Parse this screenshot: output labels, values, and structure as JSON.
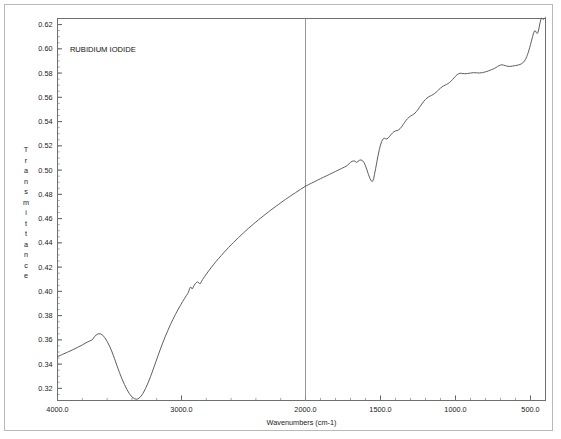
{
  "chart_data": {
    "type": "line",
    "title": "RUBIDIUM IODIDE",
    "xlabel": "Wavenumbers (cm-1)",
    "ylabel": "Transmittance",
    "grid": false,
    "legend": "none",
    "x_axis": {
      "unit": "cm-1",
      "direction": "descending",
      "piecewise": true,
      "break_at": 2000,
      "range": [
        4000.0,
        400.0
      ],
      "tick_labels": [
        "4000.0",
        "3000.0",
        "2000.0",
        "1500.0",
        "1000.0",
        "500.0"
      ],
      "tick_values": [
        4000,
        3000,
        2000,
        1500,
        1000,
        500
      ],
      "minor_tick_step_high": 200,
      "minor_tick_step_low": 100
    },
    "y_axis": {
      "ylim": [
        0.31,
        0.625
      ],
      "tick_labels": [
        "0.62",
        "0.60",
        "0.58",
        "0.56",
        "0.54",
        "0.52",
        "0.50",
        "0.48",
        "0.46",
        "0.44",
        "0.42",
        "0.40",
        "0.38",
        "0.36",
        "0.34",
        "0.32"
      ],
      "tick_values": [
        0.62,
        0.6,
        0.58,
        0.56,
        0.54,
        0.52,
        0.5,
        0.48,
        0.46,
        0.44,
        0.42,
        0.4,
        0.38,
        0.36,
        0.34,
        0.32
      ],
      "minor_tick_step": 0.005
    },
    "series": [
      {
        "name": "RUBIDIUM IODIDE",
        "color": "#555555",
        "points": [
          [
            4000,
            0.3462
          ],
          [
            3960,
            0.348
          ],
          [
            3920,
            0.3498
          ],
          [
            3880,
            0.3517
          ],
          [
            3840,
            0.3537
          ],
          [
            3800,
            0.3558
          ],
          [
            3770,
            0.3576
          ],
          [
            3740,
            0.3591
          ],
          [
            3720,
            0.36
          ],
          [
            3700,
            0.3629
          ],
          [
            3680,
            0.3646
          ],
          [
            3665,
            0.3651
          ],
          [
            3650,
            0.3648
          ],
          [
            3635,
            0.3638
          ],
          [
            3620,
            0.362
          ],
          [
            3600,
            0.3588
          ],
          [
            3580,
            0.3548
          ],
          [
            3560,
            0.35
          ],
          [
            3540,
            0.3444
          ],
          [
            3520,
            0.3386
          ],
          [
            3500,
            0.333
          ],
          [
            3480,
            0.3278
          ],
          [
            3460,
            0.3232
          ],
          [
            3440,
            0.319
          ],
          [
            3420,
            0.3156
          ],
          [
            3400,
            0.313
          ],
          [
            3380,
            0.3115
          ],
          [
            3365,
            0.311
          ],
          [
            3350,
            0.3114
          ],
          [
            3330,
            0.3131
          ],
          [
            3310,
            0.316
          ],
          [
            3290,
            0.3199
          ],
          [
            3270,
            0.3245
          ],
          [
            3250,
            0.3296
          ],
          [
            3230,
            0.3352
          ],
          [
            3210,
            0.341
          ],
          [
            3190,
            0.3468
          ],
          [
            3170,
            0.3524
          ],
          [
            3150,
            0.3578
          ],
          [
            3130,
            0.363
          ],
          [
            3110,
            0.3678
          ],
          [
            3090,
            0.3724
          ],
          [
            3070,
            0.3767
          ],
          [
            3050,
            0.3808
          ],
          [
            3030,
            0.3846
          ],
          [
            3010,
            0.3882
          ],
          [
            2990,
            0.3917
          ],
          [
            2975,
            0.3942
          ],
          [
            2960,
            0.3966
          ],
          [
            2950,
            0.3982
          ],
          [
            2945,
            0.3991
          ],
          [
            2940,
            0.4005
          ],
          [
            2935,
            0.4022
          ],
          [
            2930,
            0.4033
          ],
          [
            2925,
            0.4036
          ],
          [
            2920,
            0.4029
          ],
          [
            2915,
            0.402
          ],
          [
            2910,
            0.4024
          ],
          [
            2905,
            0.4035
          ],
          [
            2900,
            0.4046
          ],
          [
            2890,
            0.4062
          ],
          [
            2880,
            0.4073
          ],
          [
            2872,
            0.4078
          ],
          [
            2866,
            0.4076
          ],
          [
            2860,
            0.4069
          ],
          [
            2855,
            0.4063
          ],
          [
            2850,
            0.4062
          ],
          [
            2845,
            0.4068
          ],
          [
            2840,
            0.408
          ],
          [
            2830,
            0.4098
          ],
          [
            2815,
            0.412
          ],
          [
            2800,
            0.4142
          ],
          [
            2780,
            0.417
          ],
          [
            2760,
            0.4197
          ],
          [
            2740,
            0.4223
          ],
          [
            2720,
            0.4248
          ],
          [
            2700,
            0.4272
          ],
          [
            2680,
            0.4295
          ],
          [
            2660,
            0.4318
          ],
          [
            2640,
            0.434
          ],
          [
            2620,
            0.4362
          ],
          [
            2600,
            0.4383
          ],
          [
            2580,
            0.4404
          ],
          [
            2560,
            0.4424
          ],
          [
            2540,
            0.4444
          ],
          [
            2520,
            0.4463
          ],
          [
            2500,
            0.4482
          ],
          [
            2480,
            0.4501
          ],
          [
            2460,
            0.4519
          ],
          [
            2440,
            0.4537
          ],
          [
            2420,
            0.4555
          ],
          [
            2400,
            0.4572
          ],
          [
            2380,
            0.4589
          ],
          [
            2360,
            0.4606
          ],
          [
            2340,
            0.4622
          ],
          [
            2320,
            0.4638
          ],
          [
            2300,
            0.4654
          ],
          [
            2280,
            0.467
          ],
          [
            2260,
            0.4685
          ],
          [
            2240,
            0.47
          ],
          [
            2220,
            0.4715
          ],
          [
            2200,
            0.473
          ],
          [
            2180,
            0.4745
          ],
          [
            2160,
            0.4759
          ],
          [
            2140,
            0.4773
          ],
          [
            2120,
            0.4787
          ],
          [
            2100,
            0.4801
          ],
          [
            2080,
            0.4814
          ],
          [
            2060,
            0.4828
          ],
          [
            2040,
            0.4841
          ],
          [
            2020,
            0.4854
          ],
          [
            2000,
            0.4867
          ],
          [
            1980,
            0.488
          ],
          [
            1960,
            0.4892
          ],
          [
            1940,
            0.4904
          ],
          [
            1920,
            0.4917
          ],
          [
            1900,
            0.4929
          ],
          [
            1880,
            0.4941
          ],
          [
            1860,
            0.4953
          ],
          [
            1840,
            0.4965
          ],
          [
            1820,
            0.4977
          ],
          [
            1800,
            0.4989
          ],
          [
            1780,
            0.5001
          ],
          [
            1760,
            0.5013
          ],
          [
            1740,
            0.5025
          ],
          [
            1730,
            0.5031
          ],
          [
            1720,
            0.504
          ],
          [
            1710,
            0.5052
          ],
          [
            1700,
            0.5064
          ],
          [
            1690,
            0.5072
          ],
          [
            1680,
            0.5076
          ],
          [
            1670,
            0.5073
          ],
          [
            1660,
            0.5063
          ],
          [
            1650,
            0.5072
          ],
          [
            1640,
            0.5081
          ],
          [
            1630,
            0.5084
          ],
          [
            1620,
            0.5078
          ],
          [
            1610,
            0.5062
          ],
          [
            1600,
            0.5035
          ],
          [
            1590,
            0.5
          ],
          [
            1580,
            0.4962
          ],
          [
            1570,
            0.493
          ],
          [
            1562,
            0.4912
          ],
          [
            1556,
            0.4906
          ],
          [
            1550,
            0.4913
          ],
          [
            1545,
            0.4932
          ],
          [
            1540,
            0.4965
          ],
          [
            1532,
            0.5015
          ],
          [
            1524,
            0.507
          ],
          [
            1516,
            0.5122
          ],
          [
            1508,
            0.5168
          ],
          [
            1500,
            0.5207
          ],
          [
            1492,
            0.5236
          ],
          [
            1484,
            0.5255
          ],
          [
            1478,
            0.5262
          ],
          [
            1472,
            0.5262
          ],
          [
            1465,
            0.5258
          ],
          [
            1458,
            0.5257
          ],
          [
            1450,
            0.5263
          ],
          [
            1440,
            0.5277
          ],
          [
            1430,
            0.5293
          ],
          [
            1420,
            0.5307
          ],
          [
            1410,
            0.5317
          ],
          [
            1400,
            0.5323
          ],
          [
            1390,
            0.5326
          ],
          [
            1380,
            0.5331
          ],
          [
            1370,
            0.5341
          ],
          [
            1360,
            0.5356
          ],
          [
            1350,
            0.5374
          ],
          [
            1340,
            0.5392
          ],
          [
            1330,
            0.5409
          ],
          [
            1320,
            0.5424
          ],
          [
            1310,
            0.5436
          ],
          [
            1300,
            0.5445
          ],
          [
            1290,
            0.5452
          ],
          [
            1280,
            0.546
          ],
          [
            1270,
            0.547
          ],
          [
            1260,
            0.5484
          ],
          [
            1250,
            0.55
          ],
          [
            1240,
            0.5518
          ],
          [
            1230,
            0.5536
          ],
          [
            1220,
            0.5553
          ],
          [
            1210,
            0.5569
          ],
          [
            1200,
            0.5583
          ],
          [
            1190,
            0.5594
          ],
          [
            1180,
            0.5603
          ],
          [
            1170,
            0.561
          ],
          [
            1160,
            0.5616
          ],
          [
            1150,
            0.5623
          ],
          [
            1140,
            0.5631
          ],
          [
            1130,
            0.5641
          ],
          [
            1120,
            0.5653
          ],
          [
            1110,
            0.5665
          ],
          [
            1100,
            0.5676
          ],
          [
            1090,
            0.5686
          ],
          [
            1080,
            0.5694
          ],
          [
            1070,
            0.57
          ],
          [
            1060,
            0.5706
          ],
          [
            1050,
            0.5713
          ],
          [
            1040,
            0.5722
          ],
          [
            1030,
            0.5733
          ],
          [
            1020,
            0.5746
          ],
          [
            1010,
            0.576
          ],
          [
            1000,
            0.5774
          ],
          [
            990,
            0.5786
          ],
          [
            980,
            0.5794
          ],
          [
            970,
            0.5798
          ],
          [
            960,
            0.5798
          ],
          [
            950,
            0.5796
          ],
          [
            940,
            0.5795
          ],
          [
            930,
            0.5795
          ],
          [
            920,
            0.5796
          ],
          [
            910,
            0.5798
          ],
          [
            900,
            0.58
          ],
          [
            890,
            0.5802
          ],
          [
            880,
            0.5803
          ],
          [
            870,
            0.5803
          ],
          [
            860,
            0.5802
          ],
          [
            850,
            0.5801
          ],
          [
            840,
            0.5801
          ],
          [
            830,
            0.5802
          ],
          [
            820,
            0.5804
          ],
          [
            810,
            0.5807
          ],
          [
            800,
            0.581
          ],
          [
            790,
            0.5814
          ],
          [
            780,
            0.5818
          ],
          [
            770,
            0.5823
          ],
          [
            760,
            0.5828
          ],
          [
            750,
            0.5833
          ],
          [
            740,
            0.5839
          ],
          [
            730,
            0.5846
          ],
          [
            720,
            0.5854
          ],
          [
            710,
            0.5861
          ],
          [
            700,
            0.5866
          ],
          [
            690,
            0.5868
          ],
          [
            680,
            0.5866
          ],
          [
            670,
            0.5862
          ],
          [
            660,
            0.5858
          ],
          [
            650,
            0.5856
          ],
          [
            640,
            0.5855
          ],
          [
            630,
            0.5856
          ],
          [
            620,
            0.5858
          ],
          [
            610,
            0.586
          ],
          [
            600,
            0.5862
          ],
          [
            590,
            0.5864
          ],
          [
            580,
            0.5867
          ],
          [
            570,
            0.5871
          ],
          [
            560,
            0.5877
          ],
          [
            550,
            0.5886
          ],
          [
            545,
            0.5892
          ],
          [
            540,
            0.59
          ],
          [
            535,
            0.591
          ],
          [
            530,
            0.5922
          ],
          [
            525,
            0.5936
          ],
          [
            520,
            0.5952
          ],
          [
            515,
            0.597
          ],
          [
            510,
            0.599
          ],
          [
            505,
            0.6012
          ],
          [
            500,
            0.6035
          ],
          [
            495,
            0.6058
          ],
          [
            490,
            0.6082
          ],
          [
            486,
            0.6102
          ],
          [
            482,
            0.612
          ],
          [
            478,
            0.6135
          ],
          [
            474,
            0.6146
          ],
          [
            470,
            0.615
          ],
          [
            466,
            0.6146
          ],
          [
            462,
            0.6136
          ],
          [
            458,
            0.6128
          ],
          [
            454,
            0.6127
          ],
          [
            450,
            0.6136
          ],
          [
            446,
            0.6155
          ],
          [
            442,
            0.618
          ],
          [
            438,
            0.6205
          ],
          [
            434,
            0.6228
          ],
          [
            430,
            0.6245
          ],
          [
            426,
            0.6252
          ],
          [
            422,
            0.625
          ],
          [
            418,
            0.6245
          ],
          [
            414,
            0.6243
          ],
          [
            410,
            0.6247
          ],
          [
            406,
            0.6253
          ],
          [
            402,
            0.6258
          ],
          [
            400,
            0.626
          ]
        ]
      }
    ],
    "annotations": [
      {
        "name": "series-title",
        "text": "RUBIDIUM IODIDE",
        "x": 3900,
        "y": 0.6
      }
    ],
    "vertical_divider": {
      "x": 2000,
      "color": "#8a8a8a"
    }
  }
}
